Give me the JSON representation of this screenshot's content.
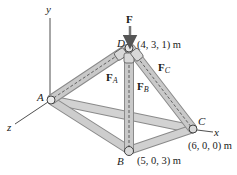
{
  "diagram": {
    "type": "3D truss / tripod structure",
    "axes": {
      "x_label": "x",
      "y_label": "y",
      "z_label": "z"
    },
    "applied_force": {
      "label": "F",
      "direction": "downward at D"
    },
    "joints": {
      "D": {
        "label": "D",
        "coords": "(4, 3, 1) m"
      },
      "A": {
        "label": "A"
      },
      "B": {
        "label": "B",
        "coords": "(5, 0, 3) m"
      },
      "C": {
        "label": "C",
        "coords": "(6, 0, 0) m"
      }
    },
    "member_forces": {
      "FA": {
        "main": "F",
        "sub": "A"
      },
      "FB": {
        "main": "F",
        "sub": "B"
      },
      "FC": {
        "main": "F",
        "sub": "C"
      }
    },
    "members": [
      "D-A",
      "D-B",
      "D-C",
      "A-B",
      "A-C",
      "B-C"
    ],
    "colors": {
      "member_fill": "#c9c9c9",
      "member_edge": "#8a8a8a",
      "ink": "#1a1a1a"
    }
  }
}
